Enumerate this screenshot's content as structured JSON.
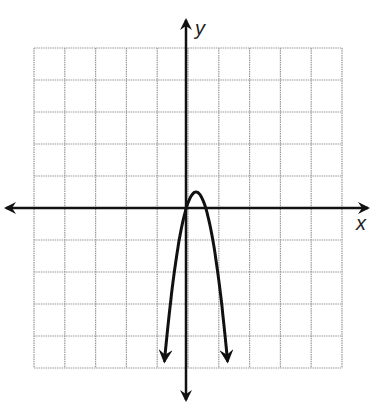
{
  "chart_data": {
    "type": "line",
    "title": "",
    "xlabel": "x",
    "ylabel": "y",
    "grid": true,
    "grid_cells": {
      "columns": 10,
      "rows": 10
    },
    "xlim": [
      -5,
      5
    ],
    "ylim": [
      -5,
      5
    ],
    "series": [
      {
        "name": "parabola",
        "description": "downward-opening parabola with arrows on both ends",
        "vertex": [
          0.33,
          0.5
        ],
        "x_intercepts": [
          0,
          0.65
        ],
        "endpoints": [
          [
            -0.7,
            -4.8
          ],
          [
            1.35,
            -4.8
          ]
        ],
        "equation_approx": "y = -5(x - 0.33)^2 + 0.5"
      }
    ],
    "colors": {
      "axis": "#111111",
      "grid": "#9a9a9a",
      "curve": "#111111"
    }
  },
  "labels": {
    "x": "x",
    "y": "y"
  }
}
